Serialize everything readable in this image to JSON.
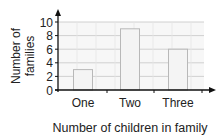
{
  "chart_data": {
    "type": "bar",
    "title": "",
    "categories": [
      "One",
      "Two",
      "Three"
    ],
    "values": [
      3,
      9,
      6
    ],
    "xlabel": "Number of children in family",
    "ylabel": "Number of families",
    "ylabel_lines": [
      "Number of",
      "families"
    ],
    "ylim": [
      0,
      10
    ],
    "yticks": [
      0,
      2,
      4,
      6,
      8,
      10
    ],
    "grid": true,
    "legend": null,
    "colors": {
      "bar_fill": "#f4f4f4",
      "bar_stroke": "#b8b8b8",
      "grid": "#d0d0d0",
      "plot_bg": "#f7f7f7",
      "axis": "#111111"
    }
  }
}
